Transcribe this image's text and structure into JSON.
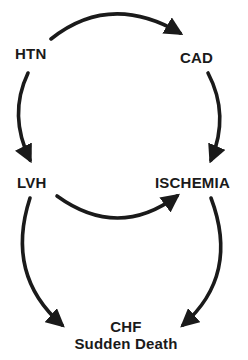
{
  "diagram": {
    "type": "flow",
    "nodes": [
      {
        "id": "htn",
        "label": "HTN"
      },
      {
        "id": "cad",
        "label": "CAD"
      },
      {
        "id": "lvh",
        "label": "LVH"
      },
      {
        "id": "ischemia",
        "label": "ISCHEMIA"
      },
      {
        "id": "chf",
        "label_lines": [
          "CHF",
          "Sudden Death"
        ]
      }
    ],
    "edges": [
      {
        "from": "htn",
        "to": "cad"
      },
      {
        "from": "htn",
        "to": "lvh"
      },
      {
        "from": "cad",
        "to": "ischemia"
      },
      {
        "from": "lvh",
        "to": "ischemia"
      },
      {
        "from": "lvh",
        "to": "chf"
      },
      {
        "from": "ischemia",
        "to": "chf"
      }
    ],
    "colors": {
      "ink": "#1a1a1a",
      "background": "#ffffff"
    }
  }
}
